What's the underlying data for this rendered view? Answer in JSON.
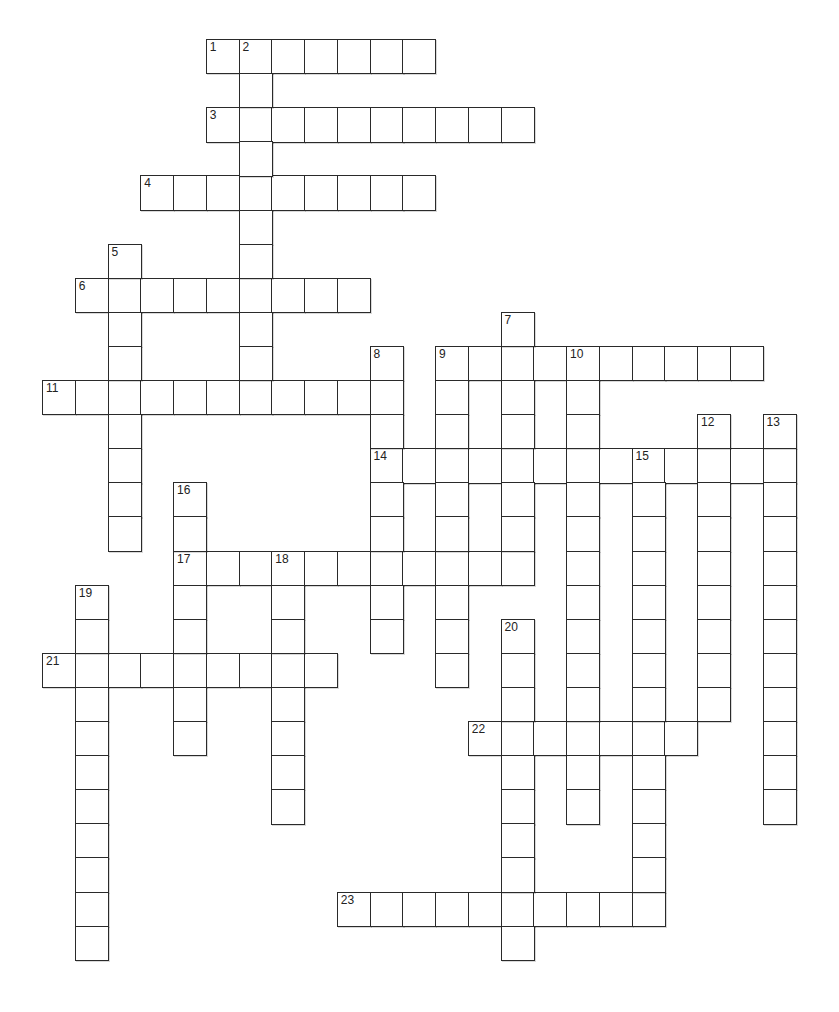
{
  "puzzle": {
    "type": "crossword",
    "grid_origin": {
      "x": 42,
      "y": 39
    },
    "cell_size": {
      "w": 32.75,
      "h": 34.1
    },
    "colors": {
      "border": "#2a2a2a",
      "cell_bg": "#ffffff",
      "page_bg": "#ffffff",
      "number": "#222222"
    },
    "across": [
      {
        "number": "1",
        "row": 0,
        "col": 5,
        "length": 7
      },
      {
        "number": "3",
        "row": 2,
        "col": 5,
        "length": 10
      },
      {
        "number": "4",
        "row": 4,
        "col": 3,
        "length": 9
      },
      {
        "number": "6",
        "row": 7,
        "col": 1,
        "length": 9
      },
      {
        "number": "9",
        "row": 9,
        "col": 12,
        "length": 10
      },
      {
        "number": "11",
        "row": 10,
        "col": 0,
        "length": 10
      },
      {
        "number": "14",
        "row": 12,
        "col": 10,
        "length": 13
      },
      {
        "number": "17",
        "row": 15,
        "col": 4,
        "length": 11
      },
      {
        "number": "21",
        "row": 18,
        "col": 0,
        "length": 9
      },
      {
        "number": "22",
        "row": 20,
        "col": 13,
        "length": 7
      },
      {
        "number": "23",
        "row": 25,
        "col": 9,
        "length": 10
      }
    ],
    "down": [
      {
        "number": "2",
        "row": 0,
        "col": 6,
        "length": 10
      },
      {
        "number": "5",
        "row": 6,
        "col": 2,
        "length": 9
      },
      {
        "number": "7",
        "row": 8,
        "col": 14,
        "length": 8
      },
      {
        "number": "8",
        "row": 9,
        "col": 10,
        "length": 9
      },
      {
        "number": "9",
        "row": 9,
        "col": 12,
        "length": 10
      },
      {
        "number": "10",
        "row": 9,
        "col": 16,
        "length": 14
      },
      {
        "number": "12",
        "row": 11,
        "col": 20,
        "length": 9
      },
      {
        "number": "13",
        "row": 11,
        "col": 22,
        "length": 12
      },
      {
        "number": "15",
        "row": 12,
        "col": 18,
        "length": 14
      },
      {
        "number": "16",
        "row": 13,
        "col": 4,
        "length": 8
      },
      {
        "number": "18",
        "row": 15,
        "col": 7,
        "length": 8
      },
      {
        "number": "19",
        "row": 16,
        "col": 1,
        "length": 11
      },
      {
        "number": "20",
        "row": 17,
        "col": 14,
        "length": 10
      }
    ]
  }
}
